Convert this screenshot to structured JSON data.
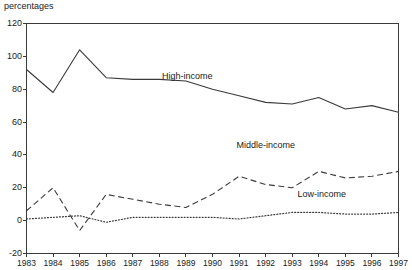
{
  "chart_data": {
    "type": "line",
    "title": "",
    "subtitle": "",
    "ylabel": "percentages",
    "xlabel": "",
    "ylim": [
      -20,
      120
    ],
    "xlim": [
      1983,
      1997
    ],
    "grid": false,
    "legend_position": "inline-annotations",
    "yticks": [
      120,
      100,
      80,
      60,
      40,
      20,
      0,
      -20
    ],
    "ytick_labels": [
      "120",
      "100",
      "80",
      "60",
      "40",
      "20",
      "0",
      "-20"
    ],
    "categories": [
      1983,
      1984,
      1985,
      1986,
      1987,
      1988,
      1989,
      1990,
      1991,
      1992,
      1993,
      1994,
      1995,
      1996,
      1997
    ],
    "xtick_labels": [
      "1983",
      "1984",
      "1985",
      "1986",
      "1987",
      "1988",
      "1989",
      "1990",
      "1991",
      "1992",
      "1993",
      "1994",
      "1995",
      "1996",
      "1997"
    ],
    "series": [
      {
        "name": "High-income",
        "label": "High-income",
        "style": "solid",
        "color": "#3a3a3a",
        "values": [
          92,
          78,
          104,
          87,
          86,
          86,
          85,
          80,
          76,
          72,
          71,
          75,
          68,
          70,
          66
        ]
      },
      {
        "name": "Middle-income",
        "label": "Middle-income",
        "style": "dashed",
        "color": "#3a3a3a",
        "values": [
          6,
          20,
          -6,
          16,
          13,
          10,
          8,
          16,
          27,
          22,
          20,
          30,
          26,
          27,
          30
        ]
      },
      {
        "name": "Low-income",
        "label": "Low-income",
        "style": "dotted",
        "color": "#3a3a3a",
        "values": [
          1,
          2,
          3,
          -1,
          2,
          2,
          2,
          2,
          1,
          3,
          5,
          5,
          4,
          4,
          5
        ]
      }
    ],
    "annotations": [
      {
        "text": "High-income",
        "x": 1988.1,
        "y": 88
      },
      {
        "text": "Middle-income",
        "x": 1990.9,
        "y": 46
      },
      {
        "text": "Low-income",
        "x": 1993.2,
        "y": 16
      }
    ]
  }
}
